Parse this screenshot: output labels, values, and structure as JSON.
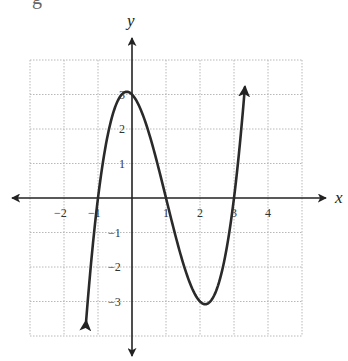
{
  "header_fragment": "g",
  "chart_data": {
    "type": "line",
    "title": "",
    "xlabel": "x",
    "ylabel": "y",
    "xlim": [
      -3,
      5
    ],
    "ylim": [
      -4,
      4
    ],
    "grid": true,
    "x_tick_labels": [
      "-2",
      "-1",
      "1",
      "2",
      "3",
      "4"
    ],
    "y_tick_labels": [
      "3",
      "2",
      "1",
      "-1",
      "-2",
      "-3"
    ],
    "function": "f(x) = (x+1)(x-1)(x-3)",
    "roots": [
      -1,
      1,
      3
    ],
    "y_intercept": 3,
    "local_max": {
      "x": -0.15,
      "y": 3.08
    },
    "local_min": {
      "x": 2.15,
      "y": -3.08
    },
    "series": [
      {
        "name": "f(x)",
        "x": [
          -1.35,
          -1.2,
          -1.0,
          -0.75,
          -0.5,
          -0.25,
          0,
          0.25,
          0.5,
          0.75,
          1.0,
          1.25,
          1.5,
          1.75,
          2.0,
          2.25,
          2.5,
          2.75,
          3.0,
          3.15,
          3.32
        ],
        "values": [
          -3.99,
          -2.46,
          0,
          1.85,
          2.81,
          3.05,
          3.0,
          2.58,
          1.88,
          0.99,
          0,
          -0.98,
          -1.88,
          -2.58,
          -3.0,
          -3.05,
          -2.63,
          -1.86,
          0,
          1.27,
          3.6
        ],
        "arrows_at_ends": true
      }
    ],
    "legend": null
  }
}
